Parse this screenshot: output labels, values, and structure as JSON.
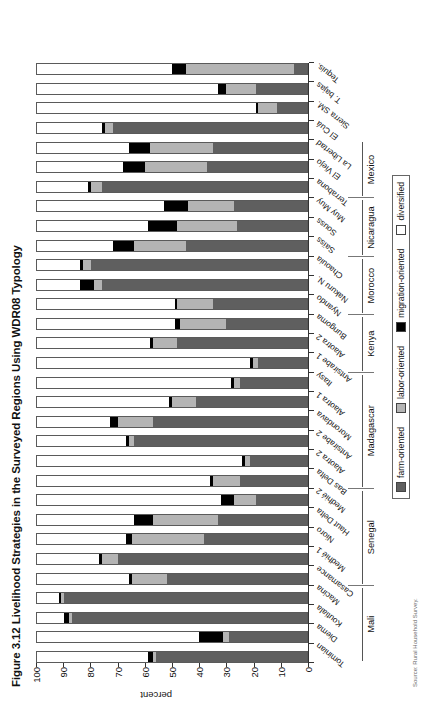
{
  "figure": {
    "title": "Figure 3.12 Livelihood Strategies in the Surveyed Regions Using WDR08 Typology",
    "source_note": "Source: Rural Household Survey."
  },
  "axis": {
    "y_title": "percent",
    "y_ticks": [
      "0",
      "10",
      "20",
      "30",
      "40",
      "50",
      "60",
      "70",
      "80",
      "90",
      "100"
    ]
  },
  "legend": {
    "items": [
      {
        "label": "farm-oriented",
        "key": "farm",
        "color": "#5f5f5f"
      },
      {
        "label": "labor-oriented",
        "key": "labor",
        "color": "#b4b4b4"
      },
      {
        "label": "migration-oriented",
        "key": "migration",
        "color": "#000000"
      },
      {
        "label": "diversified",
        "key": "diversified",
        "color": "#ffffff"
      }
    ]
  },
  "groups": [
    {
      "name": "Mali",
      "count": 4
    },
    {
      "name": "Senegal",
      "count": 5
    },
    {
      "name": "Madagascar",
      "count": 6
    },
    {
      "name": "Kenya",
      "count": 3
    },
    {
      "name": "Morocco",
      "count": 3
    },
    {
      "name": "Nicaragua",
      "count": 3
    },
    {
      "name": "Mexico",
      "count": 3
    }
  ],
  "chart_data": {
    "type": "bar",
    "title": "Figure 3.12 Livelihood Strategies in the Surveyed Regions Using WDR08 Typology",
    "xlabel": "",
    "ylabel": "percent",
    "ylim": [
      0,
      100
    ],
    "grid": false,
    "legend_position": "bottom",
    "stacked": true,
    "categories": [
      "Tominian",
      "Diema",
      "Koutiala",
      "Macina",
      "Casamance",
      "Medhié 1",
      "Nioro",
      "Haut Delta",
      "Medhié 2",
      "Bas Delta",
      "Alaotra 2",
      "Antsirabe 2",
      "Morondava",
      "Alaotra 1",
      "Itasy",
      "Antsirabe 1",
      "Alaotra 2",
      "Bungoma",
      "Nyando",
      "Nakuru N.",
      "Chaouia",
      "Saïss",
      "Souss",
      "Muy Muy",
      "Terrabona",
      "El Viejo",
      "La Libertad",
      "El Cuá",
      "Sierra SM.",
      "T. bajas",
      "Tequis."
    ],
    "series": [
      {
        "name": "farm-oriented",
        "values": [
          56,
          29,
          87,
          90,
          52,
          70,
          38,
          33,
          19,
          25,
          21,
          64,
          57,
          41,
          25,
          18,
          48,
          30,
          35,
          76,
          80,
          45,
          26,
          27,
          76,
          37,
          35,
          72,
          11,
          19,
          5
        ]
      },
      {
        "name": "labor-oriented",
        "values": [
          1,
          2,
          1,
          1,
          13,
          6,
          27,
          24,
          8,
          10,
          2,
          2,
          13,
          9,
          2,
          2,
          9,
          17,
          13,
          3,
          3,
          19,
          22,
          17,
          4,
          23,
          23,
          3,
          7,
          11,
          40
        ]
      },
      {
        "name": "migration-oriented",
        "values": [
          2,
          9,
          2,
          1,
          1,
          1,
          2,
          7,
          5,
          1,
          1,
          1,
          3,
          1,
          1,
          1,
          1,
          2,
          1,
          5,
          1,
          8,
          11,
          9,
          1,
          8,
          8,
          1,
          1,
          3,
          5
        ]
      },
      {
        "name": "diversified",
        "values": [
          41,
          60,
          10,
          8,
          34,
          23,
          33,
          36,
          68,
          64,
          76,
          33,
          27,
          49,
          72,
          79,
          42,
          51,
          51,
          16,
          16,
          28,
          41,
          47,
          19,
          32,
          34,
          24,
          81,
          67,
          50
        ]
      }
    ]
  }
}
